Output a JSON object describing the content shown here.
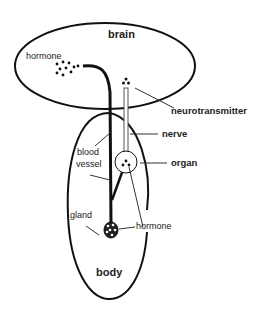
{
  "diagram": {
    "type": "neuroendocrine-signaling",
    "regions": {
      "brain": "brain",
      "body": "body"
    },
    "labels": {
      "hormone_brain": "hormone",
      "neurotransmitter": "neurotransmitter",
      "nerve": "nerve",
      "organ": "organ",
      "blood_vessel_line1": "blood",
      "blood_vessel_line2": "vessel",
      "gland": "gland",
      "hormone_gland": "hormone"
    },
    "colors": {
      "stroke": "#111111",
      "background": "#ffffff",
      "nerve_fill": "#ffffff"
    }
  }
}
